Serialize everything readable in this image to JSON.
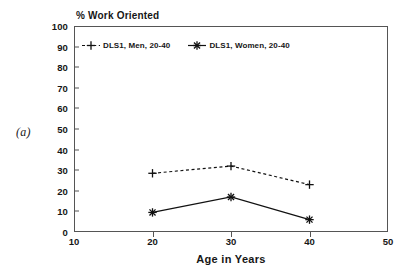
{
  "figure": {
    "panel_letter": "(a)"
  },
  "chart_data": {
    "type": "line",
    "title": "",
    "ylabel": "% Work Oriented",
    "xlabel": "Age in Years",
    "x": [
      20,
      30,
      40
    ],
    "xlim": [
      10,
      50
    ],
    "ylim": [
      0,
      100
    ],
    "x_ticks": [
      "10",
      "20",
      "30",
      "40",
      "50"
    ],
    "y_ticks": [
      "0",
      "10",
      "20",
      "30",
      "40",
      "50",
      "60",
      "70",
      "80",
      "90",
      "100"
    ],
    "grid": false,
    "legend_position": "top-left-inside",
    "series": [
      {
        "name": "DLS1, Men, 20-40",
        "marker": "plus",
        "linestyle": "dashed",
        "color": "#111111",
        "values": [
          28.5,
          32.0,
          23.0
        ]
      },
      {
        "name": "DLS1, Women, 20-40",
        "marker": "asterisk",
        "linestyle": "solid",
        "color": "#111111",
        "values": [
          9.5,
          17.0,
          6.0
        ]
      }
    ]
  }
}
